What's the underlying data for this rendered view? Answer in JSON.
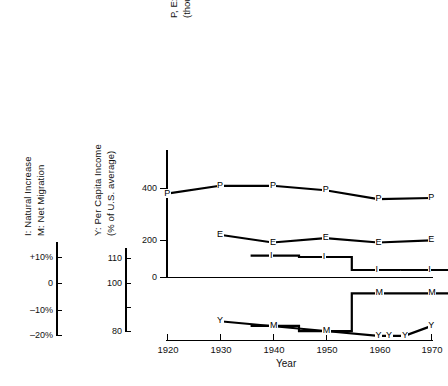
{
  "figure": {
    "xaxis_title": "Year",
    "x_ticks": [
      "1920",
      "1930",
      "1940",
      "1950",
      "1960",
      "1970"
    ],
    "x_range": [
      1920,
      1970
    ]
  },
  "left_axis_im": {
    "title_line1": "I: Natural Increase",
    "title_line2": "M: Net Migration",
    "ticks": [
      "+10%",
      "0",
      "–10%",
      "–20%"
    ],
    "tick_values": [
      10,
      0,
      -10,
      -20
    ]
  },
  "left_axis_y": {
    "title_line1": "Y: Per Capita Income",
    "title_line2": "(% of U.S. average)",
    "ticks": [
      "110",
      "100",
      "80"
    ],
    "tick_values": [
      110,
      100,
      80
    ]
  },
  "main_axis": {
    "title_line1": "P, E: Population, Employment",
    "title_line2": "(thousands)",
    "ticks": [
      "400",
      "200",
      "0"
    ],
    "tick_values": [
      400,
      200,
      0
    ]
  },
  "chart_data": {
    "type": "line",
    "title": "",
    "xlabel": "Year",
    "ylabel": "P, E: Population, Employment (thousands)",
    "xlim": [
      1918,
      1972
    ],
    "ylim": [
      0,
      470
    ],
    "grid": false,
    "legend": "inline-point-markers",
    "series": [
      {
        "name": "P",
        "label": "P",
        "description": "Population (thousands)",
        "axis": "main",
        "style": "line",
        "x": [
          1920,
          1930,
          1940,
          1950,
          1960,
          1970
        ],
        "values": [
          375,
          410,
          410,
          390,
          350,
          355
        ]
      },
      {
        "name": "E",
        "label": "E",
        "description": "Employment (thousands)",
        "axis": "main",
        "style": "line",
        "x": [
          1930,
          1940,
          1950,
          1960,
          1970
        ],
        "values": [
          190,
          155,
          175,
          155,
          165
        ]
      },
      {
        "name": "I",
        "label": "I",
        "description": "Natural increase (% per decade)",
        "axis": "left-percent",
        "style": "step",
        "x": [
          1940,
          1950,
          1960,
          1970
        ],
        "values": [
          10.5,
          10.0,
          5.0,
          5.0
        ]
      },
      {
        "name": "Y",
        "label": "Y",
        "description": "Per capita income (% of U.S. average)",
        "axis": "left-income",
        "style": "line",
        "x": [
          1930,
          1950,
          1960,
          1962,
          1965,
          1970
        ],
        "values": [
          84,
          80,
          78,
          78,
          78,
          82
        ]
      },
      {
        "name": "M",
        "label": "M",
        "description": "Net migration (% per decade)",
        "axis": "left-percent",
        "style": "step",
        "x": [
          1940,
          1950,
          1960,
          1970
        ],
        "values": [
          -16.5,
          -18.5,
          -4.0,
          -4.0
        ]
      }
    ]
  }
}
